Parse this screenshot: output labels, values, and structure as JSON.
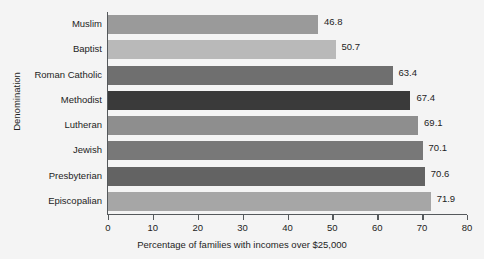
{
  "chart_data": {
    "type": "bar",
    "orientation": "horizontal",
    "title": "",
    "xlabel": "Percentage of families with incomes over $25,000",
    "ylabel": "Denomination",
    "categories": [
      "Muslim",
      "Baptist",
      "Roman Catholic",
      "Methodist",
      "Lutheran",
      "Jewish",
      "Presbyterian",
      "Episcopalian"
    ],
    "values": [
      46.8,
      50.7,
      63.4,
      67.4,
      69.1,
      70.1,
      70.6,
      71.9
    ],
    "value_labels": [
      "46.8",
      "50.7",
      "63.4",
      "67.4",
      "69.1",
      "70.1",
      "70.6",
      "71.9"
    ],
    "bar_colors": [
      "#9a9a9a",
      "#b9b9b9",
      "#6f6f6f",
      "#3a3a3a",
      "#8e8e8e",
      "#787878",
      "#636363",
      "#a6a6a6"
    ],
    "xlim": [
      0,
      80
    ],
    "xticks": [
      0,
      10,
      20,
      30,
      40,
      50,
      60,
      70,
      80
    ],
    "xtick_labels": [
      "0",
      "10",
      "20",
      "30",
      "40",
      "50",
      "60",
      "70",
      "80"
    ],
    "grid": false,
    "legend": null,
    "background_color": "#f4f4f4",
    "axis_color": "#55595c"
  }
}
